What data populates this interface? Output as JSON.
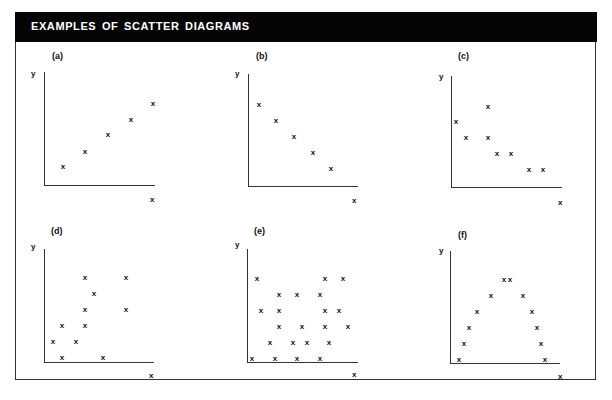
{
  "title": "EXAMPLES OF SCATTER DIAGRAMS",
  "chart_data": [
    {
      "type": "scatter",
      "label": "(a)",
      "title": "(a)",
      "xlabel": "x",
      "ylabel": "y",
      "description": "positive linear correlation",
      "points": [
        [
          1,
          1
        ],
        [
          2,
          2
        ],
        [
          3,
          3
        ],
        [
          4,
          4
        ],
        [
          5,
          5
        ]
      ]
    },
    {
      "type": "scatter",
      "label": "(b)",
      "title": "(b)",
      "xlabel": "x",
      "ylabel": "y",
      "description": "negative linear correlation",
      "points": [
        [
          1,
          5
        ],
        [
          2,
          4
        ],
        [
          3,
          3
        ],
        [
          4,
          2
        ],
        [
          5,
          1
        ]
      ]
    },
    {
      "type": "scatter",
      "label": "(c)",
      "title": "(c)",
      "xlabel": "x",
      "ylabel": "y",
      "description": "negative correlation with scatter",
      "points": [
        [
          1,
          4
        ],
        [
          2,
          3
        ],
        [
          4,
          5
        ],
        [
          4,
          3
        ],
        [
          5,
          2
        ],
        [
          6,
          2
        ],
        [
          8,
          1
        ],
        [
          9,
          1
        ]
      ]
    },
    {
      "type": "scatter",
      "label": "(d)",
      "title": "(d)",
      "xlabel": "x",
      "ylabel": "y",
      "description": "weak positive correlation",
      "points": [
        [
          1,
          1
        ],
        [
          2,
          2
        ],
        [
          2,
          0
        ],
        [
          4,
          1
        ],
        [
          4,
          2
        ],
        [
          4,
          3
        ],
        [
          4,
          5
        ],
        [
          5,
          4
        ],
        [
          6,
          0
        ],
        [
          8,
          5
        ],
        [
          8,
          3
        ]
      ]
    },
    {
      "type": "scatter",
      "label": "(e)",
      "title": "(e)",
      "xlabel": "x",
      "ylabel": "y",
      "description": "no correlation",
      "points": [
        [
          1,
          0
        ],
        [
          2,
          5
        ],
        [
          3,
          3
        ],
        [
          4,
          1
        ],
        [
          5,
          0
        ],
        [
          5,
          2
        ],
        [
          5,
          3
        ],
        [
          5,
          4
        ],
        [
          6,
          1
        ],
        [
          7,
          0
        ],
        [
          7,
          4
        ],
        [
          8,
          2
        ],
        [
          9,
          1
        ],
        [
          10,
          0
        ],
        [
          10,
          4
        ],
        [
          11,
          5
        ],
        [
          11,
          3
        ],
        [
          11,
          2
        ],
        [
          12,
          1
        ],
        [
          13,
          3
        ],
        [
          14,
          5
        ],
        [
          15,
          2
        ]
      ]
    },
    {
      "type": "scatter",
      "label": "(f)",
      "title": "(f)",
      "xlabel": "x",
      "ylabel": "y",
      "description": "curvilinear (inverted U) relationship",
      "points": [
        [
          1,
          0
        ],
        [
          2,
          1
        ],
        [
          3,
          2
        ],
        [
          4,
          3
        ],
        [
          6,
          4
        ],
        [
          8,
          5
        ],
        [
          9,
          5
        ],
        [
          11,
          4
        ],
        [
          13,
          3
        ],
        [
          14,
          2
        ],
        [
          15,
          1
        ],
        [
          16,
          0
        ]
      ]
    }
  ],
  "panels": [
    {
      "label": "(a)",
      "y": "y",
      "x": "x"
    },
    {
      "label": "(b)",
      "y": "y",
      "x": "x"
    },
    {
      "label": "(c)",
      "y": "y",
      "x": "x"
    },
    {
      "label": "(d)",
      "y": "y",
      "x": "x"
    },
    {
      "label": "(e)",
      "y": "y",
      "x": "x"
    },
    {
      "label": "(f)",
      "y": "y",
      "x": "x"
    }
  ],
  "marker": "x",
  "pixel_points": [
    [
      [
        63,
        167
      ],
      [
        85,
        152
      ],
      [
        108,
        135
      ],
      [
        131,
        120
      ],
      [
        153,
        104
      ]
    ],
    [
      [
        259,
        105
      ],
      [
        276,
        121
      ],
      [
        294,
        137
      ],
      [
        313,
        153
      ],
      [
        331,
        169
      ]
    ],
    [
      [
        488,
        107
      ],
      [
        456,
        122
      ],
      [
        466,
        138
      ],
      [
        488,
        138
      ],
      [
        497,
        154
      ],
      [
        511,
        154
      ],
      [
        529,
        170
      ],
      [
        543,
        170
      ]
    ],
    [
      [
        85,
        278
      ],
      [
        126,
        278
      ],
      [
        94,
        294
      ],
      [
        85,
        310
      ],
      [
        126,
        310
      ],
      [
        62,
        326
      ],
      [
        85,
        326
      ],
      [
        53,
        342
      ],
      [
        76,
        342
      ],
      [
        62,
        358
      ],
      [
        103,
        358
      ]
    ],
    [
      [
        257,
        279
      ],
      [
        325,
        279
      ],
      [
        343,
        279
      ],
      [
        279,
        295
      ],
      [
        297,
        295
      ],
      [
        320,
        295
      ],
      [
        261,
        311
      ],
      [
        279,
        311
      ],
      [
        325,
        311
      ],
      [
        339,
        311
      ],
      [
        279,
        327
      ],
      [
        302,
        327
      ],
      [
        325,
        327
      ],
      [
        348,
        327
      ],
      [
        270,
        343
      ],
      [
        293,
        343
      ],
      [
        307,
        343
      ],
      [
        329,
        343
      ],
      [
        252,
        359
      ],
      [
        275,
        359
      ],
      [
        297,
        359
      ],
      [
        320,
        359
      ]
    ],
    [
      [
        504,
        280
      ],
      [
        510,
        280
      ],
      [
        491,
        296
      ],
      [
        523,
        296
      ],
      [
        477,
        312
      ],
      [
        532,
        312
      ],
      [
        469,
        328
      ],
      [
        537,
        328
      ],
      [
        464,
        344
      ],
      [
        541,
        344
      ],
      [
        459,
        360
      ],
      [
        545,
        360
      ]
    ]
  ],
  "layout": [
    {
      "labelPos": [
        52,
        51
      ],
      "yLabel": [
        31,
        69
      ],
      "yAxis": [
        44,
        72,
        113
      ],
      "xAxis": [
        44,
        185,
        111
      ],
      "xLabel": [
        150,
        195
      ]
    },
    {
      "labelPos": [
        256,
        51
      ],
      "yLabel": [
        235,
        69
      ],
      "yAxis": [
        248,
        74,
        112
      ],
      "xAxis": [
        248,
        186,
        110
      ],
      "xLabel": [
        352,
        196
      ]
    },
    {
      "labelPos": [
        458,
        51
      ],
      "yLabel": [
        439,
        72
      ],
      "yAxis": [
        451,
        76,
        111
      ],
      "xAxis": [
        451,
        187,
        111
      ],
      "xLabel": [
        558,
        198
      ]
    },
    {
      "labelPos": [
        51,
        226
      ],
      "yLabel": [
        31,
        242
      ],
      "yAxis": [
        44,
        249,
        113
      ],
      "xAxis": [
        44,
        362,
        110
      ],
      "xLabel": [
        149,
        371
      ]
    },
    {
      "labelPos": [
        254,
        226
      ],
      "yLabel": [
        235,
        240
      ],
      "yAxis": [
        247,
        249,
        113
      ],
      "xAxis": [
        247,
        362,
        111
      ],
      "xLabel": [
        352,
        370
      ]
    },
    {
      "labelPos": [
        458,
        230
      ],
      "yLabel": [
        439,
        246
      ],
      "yAxis": [
        450,
        251,
        112
      ],
      "xAxis": [
        450,
        363,
        110
      ],
      "xLabel": [
        558,
        372
      ]
    }
  ]
}
